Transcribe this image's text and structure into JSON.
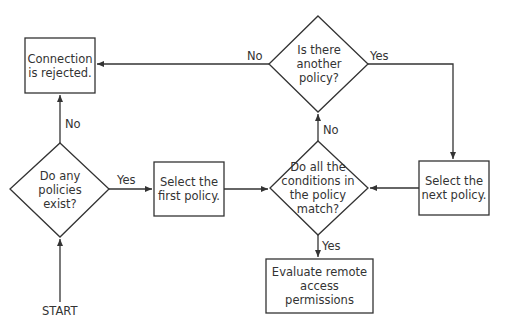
{
  "flowchart": {
    "start": "START",
    "nodes": {
      "rejected": {
        "type": "process",
        "lines": [
          "Connection",
          "is rejected."
        ]
      },
      "any_policies": {
        "type": "decision",
        "lines": [
          "Do any",
          "policies",
          "exist?"
        ]
      },
      "select_first": {
        "type": "process",
        "lines": [
          "Select the",
          "first policy."
        ]
      },
      "conditions_match": {
        "type": "decision",
        "lines": [
          "Do all the",
          "conditions in",
          "the policy",
          "match?"
        ]
      },
      "another_policy": {
        "type": "decision",
        "lines": [
          "Is there",
          "another",
          "policy?"
        ]
      },
      "select_next": {
        "type": "process",
        "lines": [
          "Select the",
          "next policy."
        ]
      },
      "evaluate": {
        "type": "process",
        "lines": [
          "Evaluate remote",
          "access permissions"
        ]
      }
    },
    "edges": {
      "any_no": "No",
      "any_yes": "Yes",
      "match_no": "No",
      "match_yes": "Yes",
      "another_no": "No",
      "another_yes": "Yes"
    }
  },
  "colors": {
    "stroke": "#333333",
    "background": "#ffffff"
  }
}
